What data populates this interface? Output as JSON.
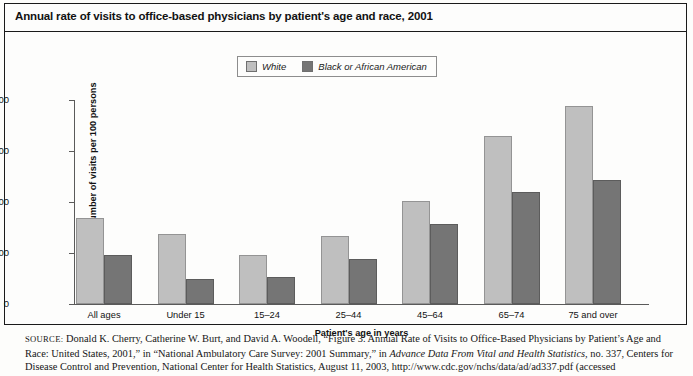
{
  "figure": {
    "title": "Annual rate of visits to office-based physicians by patient's age and race, 2001"
  },
  "legend": {
    "entries": [
      {
        "label": "White",
        "color": "#bfbfbf"
      },
      {
        "label": "Black or African American",
        "color": "#757575"
      }
    ]
  },
  "axes": {
    "y_label": "Number of visits per 100 persons",
    "x_label": "Patient's age in years",
    "y_ticks": [
      "800",
      "600",
      "400",
      "200",
      "0"
    ]
  },
  "source": {
    "keyword": "SOURCE:",
    "text_part1": " Donald K. Cherry, Catherine W. Burt, and David A. Woodell, “Figure 3. Annual Rate of Visits to Office-Based Physicians by Patient’s Age and Race: United States, 2001,” in “National Ambulatory Care Survey: 2001 Summary,” in ",
    "italic_title": "Advance Data From Vital and Health Statistics,",
    "text_part2": " no. 337, Centers for Disease Control and Prevention, National Center for Health Statistics, August 11, 2003, http://www.cdc.gov/nchs/data/ad/ad337.pdf (accessed"
  },
  "chart_data": {
    "type": "bar",
    "title": "Annual rate of visits to office-based physicians by patient's age and race, 2001",
    "xlabel": "Patient's age in years",
    "ylabel": "Number of visits per 100 persons",
    "ylim": [
      0,
      800
    ],
    "ytick_step": 200,
    "grid": false,
    "legend_position": "top-center",
    "categories": [
      "All ages",
      "Under 15",
      "15–24",
      "25–44",
      "45–64",
      "65–74",
      "75 and over"
    ],
    "series": [
      {
        "name": "White",
        "color": "#bfbfbf",
        "values": [
          338,
          274,
          191,
          266,
          403,
          659,
          776
        ]
      },
      {
        "name": "Black or African American",
        "color": "#757575",
        "values": [
          191,
          100,
          104,
          177,
          313,
          440,
          488
        ]
      }
    ]
  }
}
